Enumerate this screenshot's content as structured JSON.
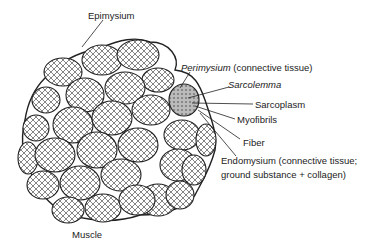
{
  "diagram": {
    "labels": {
      "epimysium": "Epimysium",
      "perimysium_term": "Perimysium",
      "perimysium_desc": " (connective tissue)",
      "sarcolemma": "Sarcolemma",
      "sarcoplasm": "Sarcoplasm",
      "myofibrils": "Myofibrils",
      "fiber": "Fiber",
      "endomysium_line1": "Endomysium (connective tissue;",
      "endomysium_line2": "ground substance + collagen)",
      "muscle": "Muscle"
    },
    "colors": {
      "stroke": "#222222",
      "background": "#ffffff",
      "shaded": "#9a9a9a"
    }
  }
}
